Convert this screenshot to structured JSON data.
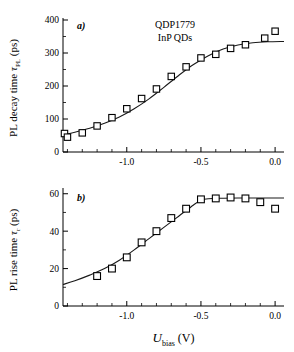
{
  "figure": {
    "annotations": {
      "sample_id": "QDP1779",
      "material": "InP QDs"
    },
    "xlabel_main": "U",
    "xlabel_sub": "bias",
    "xlabel_unit": "(V)"
  },
  "chart_data": [
    {
      "type": "scatter",
      "panel_label": "a)",
      "title": "QDP1779 InP QDs",
      "xlabel": "U_bias (V)",
      "ylabel": "PL decay time τ_PL (ps)",
      "ylabel_main": "PL decay time",
      "ylabel_tau": "τ",
      "ylabel_tausub": "PL",
      "ylabel_unit": "(ps)",
      "xlim": [
        -1.43,
        0.06
      ],
      "ylim": [
        0,
        400
      ],
      "xticks": [
        -1.0,
        -0.5,
        0.0
      ],
      "xticklabels": [
        "-1.0",
        "-0.5",
        "0.0"
      ],
      "xminorticks": [
        -1.4,
        -1.3,
        -1.2,
        -1.1,
        -0.9,
        -0.8,
        -0.7,
        -0.6,
        -0.4,
        -0.3,
        -0.2,
        -0.1
      ],
      "yticks": [
        0,
        100,
        200,
        300,
        400
      ],
      "yticklabels": [
        "0",
        "100",
        "200",
        "300",
        "400"
      ],
      "yminorticks": [
        50,
        150,
        250,
        350
      ],
      "grid": false,
      "legend": "none",
      "marker": "open-square",
      "x": [
        -1.42,
        -1.4,
        -1.3,
        -1.2,
        -1.1,
        -1.0,
        -0.9,
        -0.8,
        -0.7,
        -0.6,
        -0.5,
        -0.4,
        -0.3,
        -0.2,
        -0.07,
        0.0
      ],
      "values": [
        56,
        45,
        58,
        79,
        104,
        131,
        162,
        191,
        229,
        258,
        285,
        296,
        314,
        325,
        345,
        366
      ],
      "fit_curve": {
        "name": "sigmoid fit",
        "x": [
          -1.43,
          -1.35,
          -1.25,
          -1.15,
          -1.05,
          -0.95,
          -0.85,
          -0.75,
          -0.65,
          -0.55,
          -0.45,
          -0.35,
          -0.25,
          -0.15,
          -0.05,
          0.06
        ],
        "y": [
          52,
          60,
          72,
          87,
          106,
          131,
          161,
          196,
          232,
          265,
          292,
          312,
          324,
          331,
          334,
          335
        ]
      }
    },
    {
      "type": "scatter",
      "panel_label": "b)",
      "xlabel": "U_bias (V)",
      "ylabel": "PL rise time τ_r (ps)",
      "ylabel_main": "PL rise time",
      "ylabel_tau": "τ",
      "ylabel_tausub": "r",
      "ylabel_unit": "(ps)",
      "xlim": [
        -1.43,
        0.06
      ],
      "ylim": [
        0,
        62
      ],
      "xticks": [
        -1.0,
        -0.5,
        0.0
      ],
      "xticklabels": [
        "-1.0",
        "-0.5",
        "0.0"
      ],
      "xminorticks": [
        -1.4,
        -1.3,
        -1.2,
        -1.1,
        -0.9,
        -0.8,
        -0.7,
        -0.6,
        -0.4,
        -0.3,
        -0.2,
        -0.1
      ],
      "yticks": [
        0,
        20,
        40,
        60
      ],
      "yticklabels": [
        "0",
        "20",
        "40",
        "60"
      ],
      "yminorticks": [
        10,
        30,
        50
      ],
      "grid": false,
      "legend": "none",
      "marker": "open-square",
      "x": [
        -1.2,
        -1.1,
        -1.0,
        -0.9,
        -0.8,
        -0.7,
        -0.6,
        -0.5,
        -0.4,
        -0.3,
        -0.2,
        -0.1,
        0.0
      ],
      "values": [
        16,
        20,
        26,
        34,
        40,
        47,
        52,
        57,
        57.5,
        58,
        57.5,
        55.5,
        52
      ],
      "fit_curve": {
        "name": "saturating fit",
        "x": [
          -1.43,
          -1.35,
          -1.25,
          -1.15,
          -1.05,
          -0.95,
          -0.85,
          -0.75,
          -0.65,
          -0.55,
          -0.5,
          -0.45,
          -0.35,
          -0.25,
          -0.15,
          -0.05,
          0.06
        ],
        "y": [
          11.5,
          13.5,
          16.5,
          20,
          24.5,
          30,
          36,
          42,
          48,
          54,
          56.5,
          57.3,
          57.6,
          57.7,
          57.7,
          57.7,
          57.7
        ]
      }
    }
  ]
}
